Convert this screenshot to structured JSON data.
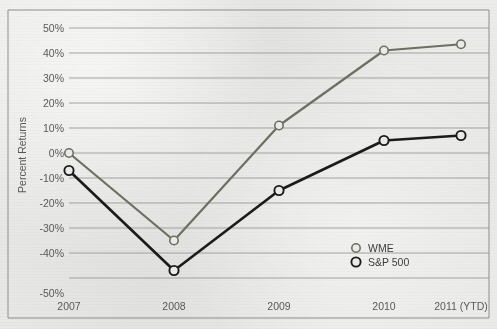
{
  "chart_data": {
    "type": "line",
    "title": "",
    "subtitle": "",
    "xlabel": "",
    "ylabel": "Percent Returns",
    "categories": [
      "2007",
      "2008",
      "2009",
      "2010",
      "2011 (YTD)"
    ],
    "x_tick_labels": [
      "2007",
      "2008",
      "2009",
      "2010",
      "2011 (YTD)"
    ],
    "y_tick_labels": [
      "50%",
      "40%",
      "30%",
      "20%",
      "10%",
      "0%",
      "-10%",
      "-20%",
      "-30%",
      "-40%",
      "-50%"
    ],
    "y_tick_values": [
      50,
      40,
      30,
      20,
      10,
      0,
      -10,
      -20,
      -30,
      -40,
      -50
    ],
    "ylim": [
      -50,
      50
    ],
    "grid": true,
    "grid_axis": "y",
    "legend_position": "inside-bottom-right",
    "marker": "open-circle",
    "series": [
      {
        "name": "WME",
        "color": "#6e6e62",
        "values": [
          0,
          -35,
          11,
          41,
          43.5
        ]
      },
      {
        "name": "S&P 500",
        "color": "#1b1b1b",
        "values": [
          -7,
          -47,
          -15,
          5,
          7
        ]
      }
    ]
  },
  "legend": {
    "entries": [
      {
        "label": "WME",
        "marker": "open-circle",
        "color": "#6e6e62"
      },
      {
        "label": "S&P 500",
        "marker": "open-circle",
        "color": "#1b1b1b"
      }
    ]
  },
  "axes": {
    "y_title": "Percent Returns"
  },
  "colors": {
    "background": "#e9e9e7",
    "plot_border": "#8d8d8a",
    "gridline": "#9a9a97",
    "tick_text": "#59595a",
    "series_wme": "#6e6e62",
    "series_sp500": "#1b1b1b"
  }
}
